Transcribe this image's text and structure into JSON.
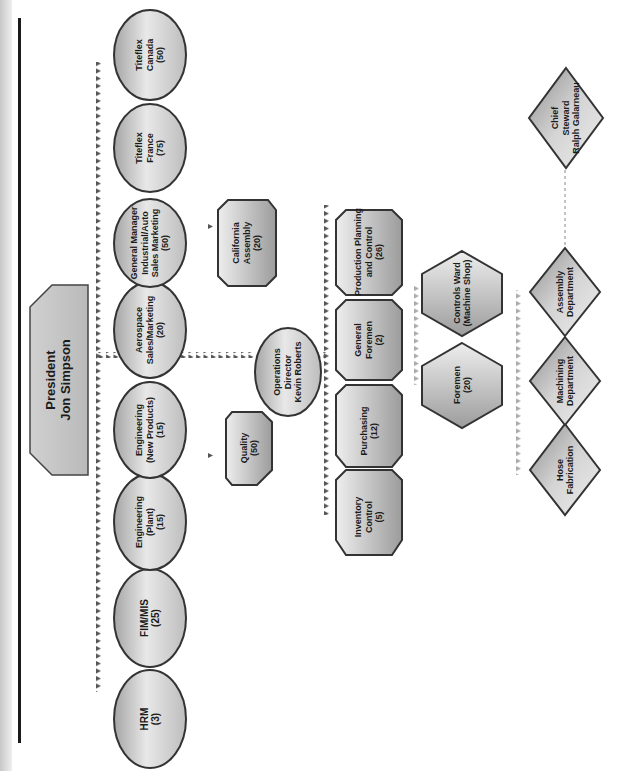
{
  "chart": {
    "type": "org-chart",
    "orientation": "rotated-90-ccw",
    "colors": {
      "node_fill_light": "#e6e6e6",
      "node_fill_dark": "#9a9a9a",
      "node_stroke": "#3a3a3a",
      "connector_dark": "#555555",
      "connector_light": "#a8a8a8"
    }
  },
  "president": {
    "title": "President",
    "name": "Jon Simpson"
  },
  "direct_reports": [
    {
      "id": "hrm",
      "line1": "HRM",
      "line2": "(3)"
    },
    {
      "id": "fim-mis",
      "line1": "FIM/MIS",
      "line2": "(25)"
    },
    {
      "id": "eng-plant",
      "line1": "Engineering",
      "line2": "(Plant)",
      "line3": "(15)"
    },
    {
      "id": "eng-new",
      "line1": "Engineering",
      "line2": "(New Products)",
      "line3": "(15)"
    },
    {
      "id": "aerospace",
      "line1": "Aerospace",
      "line2": "Sales/Marketing",
      "line3": "(20)"
    },
    {
      "id": "gm-industrial",
      "line1": "General Manager",
      "line2": "Industrial/Auto",
      "line3": "Sales Marketing",
      "line4": "(50)"
    },
    {
      "id": "titeflex-france",
      "line1": "Titeflex",
      "line2": "France",
      "line3": "(75)"
    },
    {
      "id": "titeflex-canada",
      "line1": "Titeflex",
      "line2": "Canada",
      "line3": "(50)"
    }
  ],
  "sub_units": {
    "quality": {
      "line1": "Quality",
      "line2": "(50)"
    },
    "california": {
      "line1": "California",
      "line2": "Assembly",
      "line3": "(20)"
    }
  },
  "operations": {
    "line1": "Operations",
    "line2": "Director",
    "line3": "Kevin Roberts"
  },
  "operations_reports": [
    {
      "id": "inventory",
      "line1": "Inventory",
      "line2": "Control",
      "line3": "(5)"
    },
    {
      "id": "purchasing",
      "line1": "Purchasing",
      "line2": "(12)"
    },
    {
      "id": "general-foremen",
      "line1": "General",
      "line2": "Foremen",
      "line3": "(2)"
    },
    {
      "id": "production-planning",
      "line1": "Production Planning",
      "line2": "and Control",
      "line3": "(26)"
    }
  ],
  "foremen_level": [
    {
      "id": "foremen",
      "line1": "Foremen",
      "line2": "(20)"
    },
    {
      "id": "controls-ward",
      "line1": "Controls Ward",
      "line2": "(Machine Shop)"
    }
  ],
  "departments": [
    {
      "id": "hose",
      "line1": "Hose",
      "line2": "Fabrication"
    },
    {
      "id": "machining",
      "line1": "Machining",
      "line2": "Department"
    },
    {
      "id": "assembly",
      "line1": "Assembly",
      "line2": "Department"
    }
  ],
  "union": {
    "line1": "Chief",
    "line2": "Steward",
    "line3": "Ralph Galarneau"
  }
}
